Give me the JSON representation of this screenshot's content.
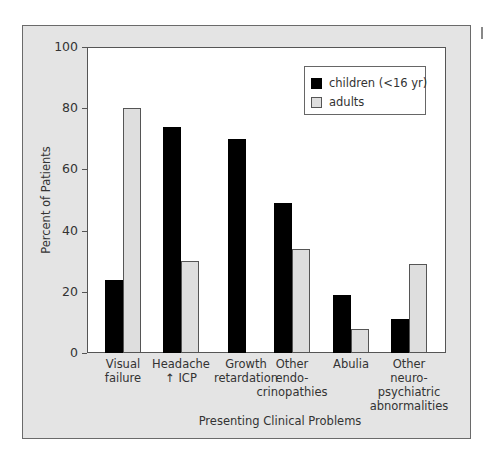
{
  "chart_data": {
    "type": "bar",
    "title": "",
    "xlabel": "Presenting Clinical Problems",
    "ylabel": "Percent of Patients",
    "ylim": [
      0,
      100
    ],
    "yticks": [
      0,
      20,
      40,
      60,
      80,
      100
    ],
    "grid": false,
    "legend_position": "upper right",
    "categories": [
      "Visual failure",
      "Headache ↑ ICP",
      "Growth retardation",
      "Other endocrinopathies",
      "Abulia",
      "Other neuropsychiatric abnormalities"
    ],
    "category_labels": [
      "Visual\nfailure",
      "Headache\n↑ ICP",
      "Growth\nretardation",
      "Other\nendo-\ncrinopathies",
      "Abulia",
      "Other\nneuro-\npsychiatric\nabnormalities"
    ],
    "series": [
      {
        "name": "children (<16 yr)",
        "color": "#000000",
        "values": [
          24,
          74,
          70,
          49,
          19,
          11
        ]
      },
      {
        "name": "adults",
        "color": "#dedede",
        "values": [
          80,
          30,
          0,
          34,
          8,
          29
        ]
      }
    ]
  },
  "colors": {
    "frame_background": "#e4e4e4",
    "plot_background": "#ffffff",
    "children": "#000000",
    "adults": "#dedede"
  }
}
